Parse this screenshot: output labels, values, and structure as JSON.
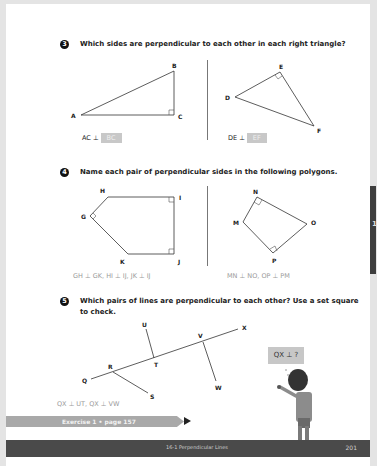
{
  "questions": [
    {
      "number": "3",
      "text": "Which sides are perpendicular to each other in each right triangle?",
      "figures": [
        {
          "vertices": [
            "A",
            "B",
            "C"
          ],
          "answer_prefix": "AC ⊥",
          "answer": "BC"
        },
        {
          "vertices": [
            "D",
            "E",
            "F"
          ],
          "answer_prefix": "DE ⊥",
          "answer": "EF"
        }
      ]
    },
    {
      "number": "4",
      "text": "Name each pair of perpendicular sides in the following polygons.",
      "figures": [
        {
          "vertices": [
            "G",
            "H",
            "I",
            "J",
            "K"
          ],
          "answer": "GH ⊥ GK, HI ⊥ IJ, JK ⊥ IJ"
        },
        {
          "vertices": [
            "M",
            "N",
            "O",
            "P"
          ],
          "answer": "MN ⊥ NO, OP ⊥ PM"
        }
      ]
    },
    {
      "number": "5",
      "text_line1": "Which pairs of lines are perpendicular to each other? Use a set square",
      "text_line2": "to check.",
      "labels": [
        "U",
        "X",
        "V",
        "T",
        "R",
        "Q",
        "S",
        "W"
      ],
      "answer": "QX ⊥ UT, QX ⊥ VW",
      "speech_bubble": "QX ⊥ ?"
    }
  ],
  "exercise": {
    "label": "Exercise 1 • page 157"
  },
  "footer": {
    "title": "16-1  Perpendicular Lines",
    "page_number": "201"
  },
  "side_tab": {
    "mark": "1"
  }
}
